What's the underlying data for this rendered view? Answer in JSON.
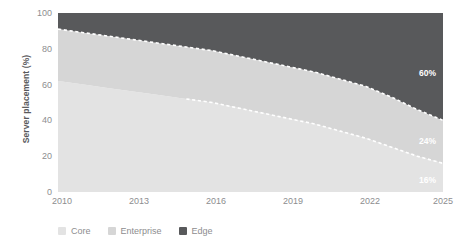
{
  "chart_data": {
    "type": "area",
    "title": "",
    "xlabel": "",
    "ylabel": "Server placement (%)",
    "xlim": [
      2010,
      2025
    ],
    "ylim": [
      0,
      100
    ],
    "grid": false,
    "stacked": true,
    "legend_position": "bottom-left",
    "x": [
      2010,
      2011,
      2012,
      2013,
      2014,
      2015,
      2016,
      2017,
      2018,
      2019,
      2020,
      2021,
      2022,
      2023,
      2024,
      2025
    ],
    "xticks": [
      "2010",
      "2013",
      "2016",
      "2019",
      "2022",
      "2025"
    ],
    "xtick_values": [
      2010,
      2013,
      2016,
      2019,
      2022,
      2025
    ],
    "yticks": [
      "0",
      "20",
      "40",
      "60",
      "80",
      "100"
    ],
    "ytick_values": [
      0,
      20,
      40,
      60,
      80,
      100
    ],
    "series": [
      {
        "name": "Core",
        "color": "#e3e3e3",
        "values": [
          62,
          60,
          58,
          56,
          54,
          52,
          50,
          47,
          44,
          41,
          38,
          34,
          30,
          25,
          20,
          16
        ],
        "boundary_style": "dashed",
        "boundary_starts_at": 2015,
        "end_label": "16%"
      },
      {
        "name": "Enterprise",
        "color": "#d6d6d6",
        "values": [
          29,
          29,
          29,
          29,
          29,
          29,
          29,
          29,
          29,
          29,
          29,
          29,
          29,
          28,
          26,
          24
        ],
        "boundary_style": "dashed",
        "end_label": "24%"
      },
      {
        "name": "Edge",
        "color": "#58595b",
        "values": [
          9,
          11,
          13,
          15,
          17,
          19,
          21,
          24,
          27,
          30,
          33,
          37,
          41,
          47,
          54,
          60
        ],
        "boundary_style": "none",
        "end_label": "60%"
      }
    ],
    "cumulative_top_core": [
      62,
      60,
      58,
      56,
      54,
      52,
      50,
      47,
      44,
      41,
      38,
      34,
      30,
      25,
      20,
      16
    ],
    "cumulative_top_enterprise": [
      91,
      89,
      87,
      85,
      83,
      81,
      79,
      76,
      73,
      70,
      67,
      63,
      59,
      53,
      46,
      40
    ],
    "annotations": [
      {
        "text": "60%",
        "series": "Edge",
        "x": 2025,
        "y": 70
      },
      {
        "text": "24%",
        "series": "Enterprise",
        "x": 2025,
        "y": 28
      },
      {
        "text": "16%",
        "series": "Core",
        "x": 2025,
        "y": 8
      }
    ]
  },
  "axes": {
    "y_title": "Server placement (%)",
    "y_ticks": [
      "100",
      "80",
      "60",
      "40",
      "20",
      "0"
    ],
    "x_ticks": [
      "2010",
      "2013",
      "2016",
      "2019",
      "2022",
      "2025"
    ]
  },
  "legend": {
    "items": [
      {
        "label": "Core",
        "color": "#e3e3e3"
      },
      {
        "label": "Enterprise",
        "color": "#d6d6d6"
      },
      {
        "label": "Edge",
        "color": "#58595b"
      }
    ]
  },
  "colors": {
    "core": "#e3e3e3",
    "enterprise": "#d6d6d6",
    "edge": "#58595b",
    "tick_text": "#8d8d8f",
    "axis_title": "#58595b",
    "divider": "#ffffff",
    "background": "#ffffff"
  }
}
